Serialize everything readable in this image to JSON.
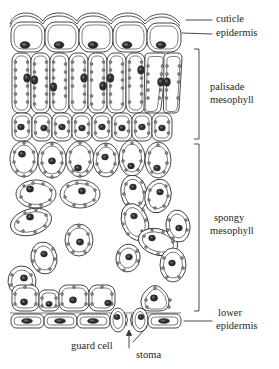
{
  "figure": {
    "labels": {
      "cuticle": "cuticle",
      "epidermis": "epidermis",
      "palisade_line1": "palisade",
      "palisade_line2": "mesophyll",
      "spongy_line1": "spongy",
      "spongy_line2": "mesophyll",
      "lower_line1": "lower",
      "lower_line2": "epidermis",
      "guard_cell": "guard  cell",
      "stoma": "stoma"
    },
    "colors": {
      "ink": "#2a2724",
      "label_ink": "#231f1d",
      "leader": "#3a3633",
      "cell_fill": "#ffffff",
      "chloroplast": "#8b8781",
      "nucleus": "#2e2b28",
      "background": "#ffffff"
    },
    "tissues": [
      {
        "name": "cuticle",
        "description": "waxy wavy outer line above upper epidermis"
      },
      {
        "name": "upper epidermis",
        "description": "single row of five rounded box cells"
      },
      {
        "name": "palisade mesophyll",
        "description": "tall columnar cells packed in two tiers"
      },
      {
        "name": "spongy mesophyll",
        "description": "loosely packed irregular cells with air spaces"
      },
      {
        "name": "lower epidermis",
        "description": "flattened row of cells at the base"
      },
      {
        "name": "stoma",
        "description": "pore between two guard cells in lower epidermis"
      }
    ],
    "counts": {
      "upper_epidermis_cells": 5,
      "palisade_cells": 22,
      "spongy_cells": 26,
      "lower_epidermis_cells": 6,
      "guard_cells": 2,
      "stomata": 1
    }
  }
}
